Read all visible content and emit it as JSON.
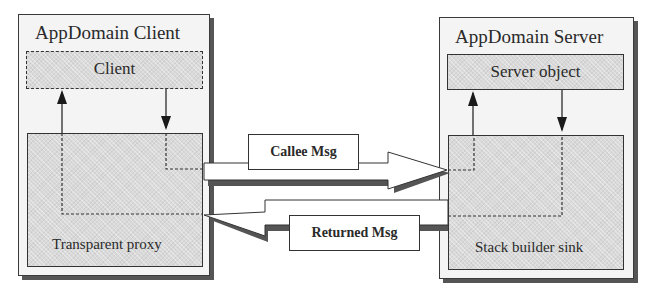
{
  "client_domain": {
    "title": "AppDomain Client",
    "client_box_label": "Client",
    "proxy_label": "Transparent proxy"
  },
  "server_domain": {
    "title": "AppDomain Server",
    "server_object_label": "Server object",
    "sink_label": "Stack builder sink"
  },
  "messages": {
    "callee": "Callee Msg",
    "returned": "Returned Msg"
  },
  "colors": {
    "outer_fill": "#f4f4f4",
    "inner_fill": "#d9d9d9",
    "line": "#2a2a2a",
    "shadow": "#555555"
  }
}
